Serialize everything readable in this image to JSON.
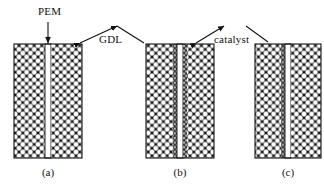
{
  "figure": {
    "width": 324,
    "height": 195,
    "background": "#ffffff",
    "ink": "#111111"
  },
  "annotations": [
    {
      "id": "pem",
      "label": "PEM",
      "x": 38,
      "y": 6,
      "leader": "straight-arrow-down",
      "target_x": 48,
      "target_y": 44
    },
    {
      "id": "gdl",
      "label": "GDL",
      "x": 99,
      "y": 34,
      "leader": "inverted-v",
      "left_target_x": 80,
      "left_target_y": 44,
      "right_target_x": 155,
      "right_target_y": 44,
      "apex_left_x": 117,
      "apex_right_x": 137,
      "apex_y": 26
    },
    {
      "id": "catalyst",
      "label": "catalyst",
      "x": 214,
      "y": 34,
      "leader": "inverted-v",
      "left_target_x": 196,
      "left_target_y": 44,
      "right_target_x": 262,
      "right_target_y": 42,
      "apex_left_x": 224,
      "apex_right_x": 246,
      "apex_y": 26
    }
  ],
  "panels": [
    {
      "id": "a",
      "caption": "(a)",
      "caption_x": 48,
      "caption_y": 167,
      "x": 14,
      "y": 44,
      "width": 68,
      "height": 114,
      "membrane": {
        "label": "PEM",
        "x": 45,
        "width": 6,
        "fill": "#ffffff"
      },
      "gdl": {
        "label": "GDL",
        "fill": "#111111",
        "pore_fill": "#ffffff",
        "left_x": 14,
        "left_width": 31,
        "right_x": 51,
        "right_width": 31
      },
      "catalyst_layers": []
    },
    {
      "id": "b",
      "caption": "(b)",
      "caption_x": 180,
      "caption_y": 167,
      "x": 146,
      "y": 44,
      "width": 68,
      "height": 114,
      "membrane": {
        "label": "PEM",
        "x": 177,
        "width": 6,
        "fill": "#ffffff"
      },
      "gdl": {
        "label": "GDL",
        "fill": "#111111",
        "pore_fill": "#ffffff",
        "left_x": 146,
        "left_width": 27,
        "right_x": 187,
        "right_width": 27
      },
      "catalyst_layers": [
        {
          "label": "catalyst",
          "x": 173,
          "width": 4,
          "pore_fill": "#b4b4b4"
        },
        {
          "label": "catalyst",
          "x": 183,
          "width": 4,
          "pore_fill": "#b4b4b4"
        }
      ]
    },
    {
      "id": "c",
      "caption": "(c)",
      "caption_x": 288,
      "caption_y": 167,
      "x": 255,
      "y": 44,
      "width": 66,
      "height": 114,
      "membrane": {
        "label": "PEM",
        "x": 285,
        "width": 6,
        "fill": "#ffffff"
      },
      "gdl": {
        "label": "GDL",
        "fill": "#111111",
        "pore_fill": "#ffffff",
        "left_x": 255,
        "left_width": 26,
        "right_x": 291,
        "right_width": 30
      },
      "catalyst_layers": [
        {
          "label": "catalyst",
          "x": 281,
          "width": 4,
          "pore_fill": "#b4b4b4"
        }
      ]
    }
  ]
}
